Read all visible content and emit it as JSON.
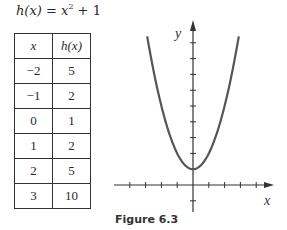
{
  "title": {
    "lhs": "h(x)",
    "eq": " = ",
    "base": "x",
    "exp": "2",
    "rest": " + 1"
  },
  "table": {
    "headers": [
      "x",
      "h(x)"
    ],
    "rows": [
      [
        "−2",
        "5"
      ],
      [
        "−1",
        "2"
      ],
      [
        "0",
        "1"
      ],
      [
        "1",
        "2"
      ],
      [
        "2",
        "5"
      ],
      [
        "3",
        "10"
      ]
    ]
  },
  "figure_caption": "Figure 6.3",
  "axes": {
    "x_label": "x",
    "y_label": "y"
  },
  "chart_data": {
    "type": "line",
    "caption": "Figure 6.3",
    "xlabel": "x",
    "ylabel": "y",
    "function": "h(x) = x^2 + 1",
    "table": {
      "x": [
        -2,
        -1,
        0,
        1,
        2,
        3
      ],
      "h": [
        5,
        2,
        1,
        2,
        5,
        10
      ]
    },
    "curve_x_range": [
      -2.9,
      2.9
    ],
    "xlim": [
      -5,
      5
    ],
    "ylim": [
      -1,
      10
    ],
    "x_ticks": [
      -4,
      -3,
      -2,
      -1,
      1,
      2,
      3,
      4
    ],
    "y_ticks": [
      -1,
      1,
      2,
      3,
      4,
      5,
      6,
      7,
      8,
      9
    ],
    "grid": false,
    "vertex": [
      0,
      1
    ]
  }
}
